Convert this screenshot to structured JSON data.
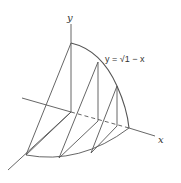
{
  "diagram": {
    "labels": {
      "y_axis": "y",
      "x_axis": "x",
      "curve": "y = √1 − x"
    },
    "colors": {
      "line": "#555555",
      "background": "#ffffff"
    }
  }
}
